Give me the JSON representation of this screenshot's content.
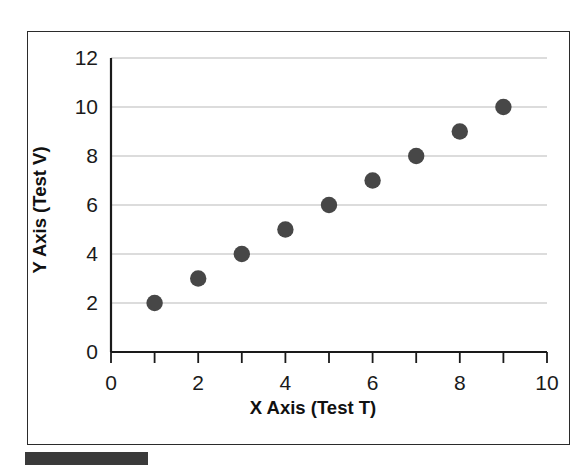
{
  "figure": {
    "caption_block_label": "redacted-caption-bar",
    "frame_label": "chart-border"
  },
  "chart_data": {
    "type": "scatter",
    "title": "",
    "xlabel": "X Axis (Test T)",
    "ylabel": "Y Axis (Test V)",
    "xlim": [
      0,
      10
    ],
    "ylim": [
      0,
      12
    ],
    "xticks": [
      0,
      2,
      4,
      6,
      8,
      10
    ],
    "xtick_labels": [
      "0",
      "2",
      "4",
      "6",
      "8",
      "10"
    ],
    "xminor_ticks": [
      1,
      3,
      5,
      7,
      9
    ],
    "yticks": [
      0,
      2,
      4,
      6,
      8,
      10,
      12
    ],
    "ytick_labels": [
      "0",
      "2",
      "4",
      "6",
      "8",
      "10",
      "12"
    ],
    "grid": "horizontal",
    "legend": "none",
    "marker": "circle",
    "marker_color": "#474747",
    "gridline_color": "#b9b9b9",
    "axis_color": "#1a1a1a",
    "x": [
      1,
      2,
      3,
      4,
      5,
      6,
      7,
      8,
      9
    ],
    "y": [
      2,
      3,
      4,
      5,
      6,
      7,
      8,
      9,
      10
    ],
    "points": [
      {
        "x": 1,
        "y": 2
      },
      {
        "x": 2,
        "y": 3
      },
      {
        "x": 3,
        "y": 4
      },
      {
        "x": 4,
        "y": 5
      },
      {
        "x": 5,
        "y": 6
      },
      {
        "x": 6,
        "y": 7
      },
      {
        "x": 7,
        "y": 8
      },
      {
        "x": 8,
        "y": 9
      },
      {
        "x": 9,
        "y": 10
      }
    ],
    "series": [
      {
        "name": "",
        "values": [
          2,
          3,
          4,
          5,
          6,
          7,
          8,
          9,
          10
        ]
      }
    ]
  }
}
